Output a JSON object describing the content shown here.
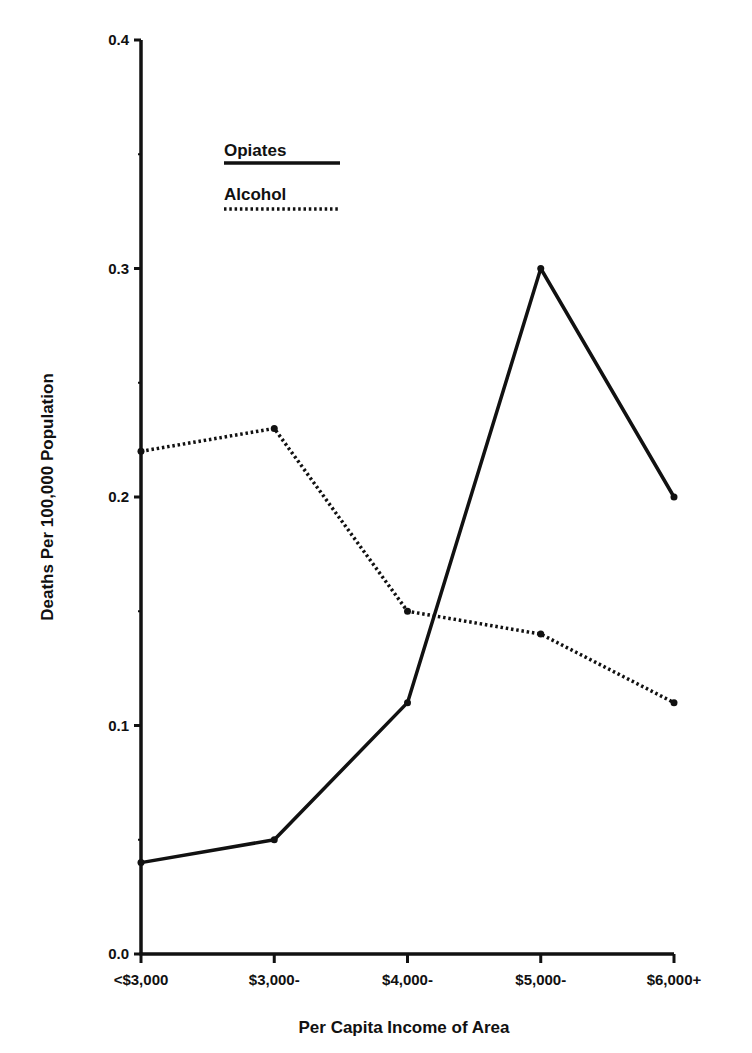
{
  "chart_data": {
    "type": "line",
    "title": "",
    "xlabel": "Per Capita Income of Area",
    "ylabel": "Deaths Per 100,000 Population",
    "categories": [
      "<$3,000",
      "$3,000-",
      "$4,000-",
      "$5,000-",
      "$6,000+"
    ],
    "series": [
      {
        "name": "Opiates",
        "style": "solid",
        "values": [
          0.04,
          0.05,
          0.11,
          0.3,
          0.2
        ]
      },
      {
        "name": "Alcohol",
        "style": "dotted",
        "values": [
          0.22,
          0.23,
          0.15,
          0.14,
          0.11
        ]
      }
    ],
    "ylim": [
      0.0,
      0.4
    ],
    "yticks": [
      "0.0",
      "0.1",
      "0.2",
      "0.3",
      "0.4"
    ],
    "grid": false,
    "legend_position": "upper-left-inside"
  },
  "colors": {
    "line": "#111111",
    "background": "#ffffff"
  }
}
